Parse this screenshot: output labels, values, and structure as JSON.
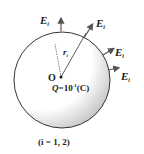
{
  "diagram": {
    "field_label": "E",
    "field_subscript": "i",
    "radius_label": "r",
    "radius_subscript": "i",
    "center_label": "O",
    "charge_label": "Q",
    "charge_value_prefix": "=10",
    "charge_exponent": "-1",
    "charge_unit": "(C)",
    "caption": "(i = 1, 2)"
  },
  "colors": {
    "stroke": "#333333",
    "shade": "#bdbdbd",
    "background": "#ffffff"
  }
}
